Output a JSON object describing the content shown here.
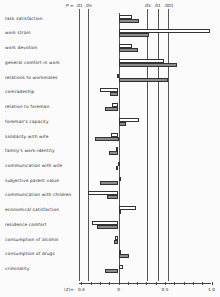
{
  "chart_data": {
    "type": "bar",
    "orientation": "horizontal",
    "title": "",
    "xlabel": "(Z)=",
    "ylabel": "",
    "xlim": [
      -0.4,
      1.0
    ],
    "x_ticks": [
      "0.4",
      "0",
      "0.5",
      "1.0"
    ],
    "significance_labels": {
      "prefix": "P =",
      "left": [
        ".01",
        ".05"
      ],
      "right": [
        ".05",
        ".01",
        ".001"
      ]
    },
    "significance_lines_x": [
      -0.42,
      -0.33,
      0.31,
      0.42,
      0.53
    ],
    "categories": [
      "task satisfaction",
      "work strain",
      "work devotion",
      "general comfort in work",
      "relations to workmates",
      "comradeship",
      "relation to foreman",
      "foreman's capacity",
      "solidarity with wife",
      "family's work-identity",
      "communication with wife",
      "subjective parent value",
      "communication with children",
      "economical satisfaction",
      "residence comfort",
      "consumption of alcohol",
      "consumption of drugs",
      "criminality"
    ],
    "series": [
      {
        "name": "open bars",
        "fill": "white",
        "values": [
          0.15,
          0.98,
          0.14,
          0.49,
          -0.02,
          -0.2,
          -0.07,
          0.22,
          -0.08,
          -0.03,
          -0.01,
          0.0,
          -0.33,
          0.19,
          -0.28,
          -0.04,
          0.02,
          0.05
        ]
      },
      {
        "name": "shaded bars",
        "fill": "gray",
        "values": [
          0.22,
          0.33,
          0.21,
          0.63,
          0.53,
          -0.09,
          -0.15,
          0.08,
          -0.25,
          -0.1,
          -0.03,
          -0.2,
          -0.12,
          0.02,
          -0.23,
          -0.05,
          0.11,
          -0.15
        ]
      }
    ],
    "grid": false,
    "legend": "none"
  }
}
